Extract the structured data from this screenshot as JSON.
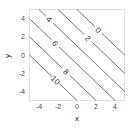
{
  "chart_data": {
    "type": "contour",
    "title": "",
    "xlabel": "x",
    "ylabel": "y",
    "xlim": [
      -5,
      5
    ],
    "ylim": [
      -5,
      5
    ],
    "xticks": [
      -4,
      -2,
      0,
      2,
      4
    ],
    "yticks": [
      -4,
      -2,
      0,
      2,
      4
    ],
    "grid": false,
    "function": "z = 5 - x - y",
    "levels": [
      0,
      2,
      4,
      6,
      8,
      10
    ],
    "contours": [
      {
        "level": 0,
        "label": "0",
        "x_plus_y": 5
      },
      {
        "level": 2,
        "label": "2",
        "x_plus_y": 3
      },
      {
        "level": 4,
        "label": "4",
        "x_plus_y": 1
      },
      {
        "level": 6,
        "label": "6",
        "x_plus_y": -1
      },
      {
        "level": 8,
        "label": "8",
        "x_plus_y": -3
      },
      {
        "level": 10,
        "label": "10",
        "x_plus_y": -5
      }
    ],
    "line_color": "#555555",
    "frame_color": "#e0e0e0"
  }
}
